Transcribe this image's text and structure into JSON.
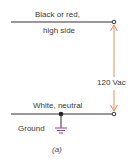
{
  "diagram": {
    "top_wire_label_line1": "Black or red,",
    "top_wire_label_line2": "high side",
    "voltage_label": "120 Vac",
    "bottom_wire_label": "White, neutral",
    "ground_label": "Ground",
    "caption": "(a)"
  },
  "colors": {
    "wire": "#333333",
    "arrow": "#f08a5d",
    "ground_symbol": "#9b3f9b"
  }
}
